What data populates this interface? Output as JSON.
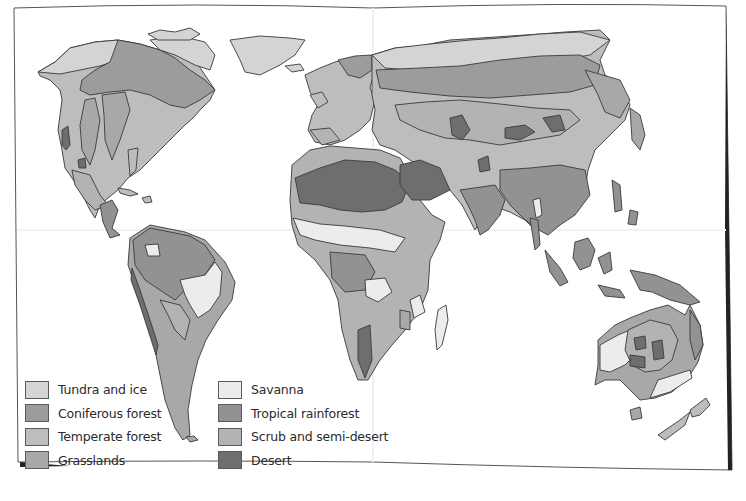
{
  "map": {
    "title": "World biomes map",
    "regions_depicted": [
      "North America",
      "South America",
      "Europe",
      "Africa",
      "Asia",
      "Australia",
      "Oceania"
    ]
  },
  "legend": {
    "items": [
      {
        "label": "Tundra and ice",
        "color": "#d4d4d4",
        "key": "tundra"
      },
      {
        "label": "Coniferous forest",
        "color": "#9c9c9c",
        "key": "coniferous"
      },
      {
        "label": "Temperate forest",
        "color": "#bdbdbd",
        "key": "temperate"
      },
      {
        "label": "Grasslands",
        "color": "#a8a8a8",
        "key": "grasslands"
      },
      {
        "label": "Savanna",
        "color": "#ececec",
        "key": "savanna"
      },
      {
        "label": "Tropical rainforest",
        "color": "#929292",
        "key": "rainforest"
      },
      {
        "label": "Scrub and semi-desert",
        "color": "#b3b3b3",
        "key": "scrub"
      },
      {
        "label": "Desert",
        "color": "#6e6e6e",
        "key": "desert"
      }
    ]
  },
  "colors": {
    "outline": "#3a3a3a",
    "paper": "#ffffff",
    "frame": "#555555"
  }
}
